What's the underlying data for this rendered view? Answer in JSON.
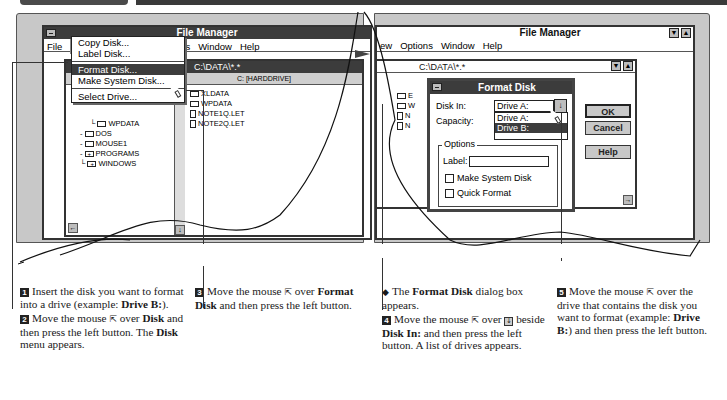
{
  "left_screen": {
    "window_title": "File Manager",
    "menu": [
      "File",
      "Disk",
      "Tree",
      "View",
      "Options",
      "Window",
      "Help"
    ],
    "active_menu": "Disk",
    "subwindow_title": "C:\\DATA\\*.*",
    "drive_label": "C: [HARDDRIVE]",
    "disk_menu": {
      "items": [
        {
          "label": "Copy Disk...",
          "highlighted": false
        },
        {
          "label": "Label Disk...",
          "highlighted": false
        },
        {
          "label": "Format Disk...",
          "highlighted": true
        },
        {
          "label": "Make System Disk...",
          "highlighted": false
        },
        {
          "label": "Select Drive...",
          "highlighted": false
        }
      ]
    },
    "tree": [
      "WPDATA",
      "DOS",
      "MOUSE1",
      "PROGRAMS",
      "WINDOWS"
    ],
    "files": [
      "XLDATA",
      "WPDATA",
      "NOTE1Q.LET",
      "NOTE2Q.LET"
    ]
  },
  "right_screen": {
    "window_title": "File Manager",
    "menu": [
      "View",
      "Options",
      "Window",
      "Help"
    ],
    "menu_partial_first": "ew",
    "subwindow_title": "C:\\DATA\\*.*",
    "tree_partial": [
      "E",
      "W",
      "N",
      "N"
    ],
    "dialog": {
      "title": "Format Disk",
      "disk_in_label": "Disk In:",
      "disk_in_value": "Drive A:",
      "capacity_label": "Capacity:",
      "drive_options": [
        {
          "label": "Drive A:",
          "selected": false
        },
        {
          "label": "Drive B:",
          "selected": true
        }
      ],
      "options_group": "Options",
      "label_field_label": "Label:",
      "label_field_value": "",
      "make_system_disk": "Make System Disk",
      "quick_format": "Quick Format",
      "ok": "OK",
      "cancel": "Cancel",
      "help": "Help"
    }
  },
  "captions": {
    "step1": {
      "num": "1",
      "text": "Insert the disk you want to format into a drive (example: ",
      "bold": "Drive B:",
      "tail": ")."
    },
    "step2": {
      "num": "2",
      "pre": "Move the mouse",
      "mid": "over",
      "bold1": "Disk",
      "mid2": "and then press the left button. The",
      "bold2": "Disk",
      "tail": "menu appears."
    },
    "step3": {
      "num": "3",
      "pre": "Move the mouse",
      "mid": "over",
      "bold": "Format Disk",
      "tail": "and then press the left button."
    },
    "note": {
      "pre": "The",
      "bold": "Format Disk",
      "tail": "dialog box appears."
    },
    "step4": {
      "num": "4",
      "pre": "Move the mouse",
      "mid": "over",
      "mid2": "beside",
      "bold": "Disk In:",
      "tail": "and then press the left button. A list of drives appears."
    },
    "step5": {
      "num": "5",
      "pre": "Move the mouse",
      "mid": "over the drive that contains the disk you want to format (example:",
      "bold": "Drive B:",
      "tail": ") and then press the left button."
    }
  },
  "icons": {
    "pointer": "⇱",
    "down_arrow_button": "↓"
  }
}
